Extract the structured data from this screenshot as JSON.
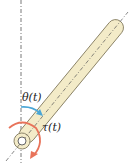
{
  "diagram": {
    "labels": {
      "angle": "θ(t)",
      "torque": "τ(t)"
    },
    "colors": {
      "rod_fill": "#f3ebc8",
      "rod_outline": "#8a8266",
      "angle_arc": "#4aa6d6",
      "torque_arc": "#e8735a",
      "reference_line": "#555555"
    }
  }
}
